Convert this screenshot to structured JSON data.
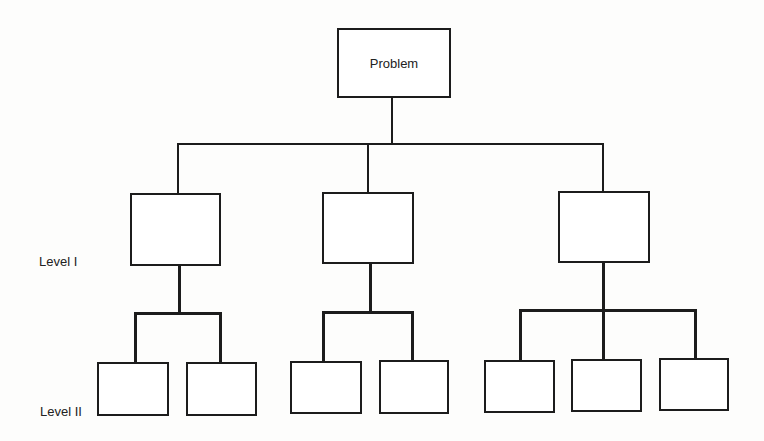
{
  "diagram": {
    "root": {
      "label": "Problem"
    },
    "levels": [
      {
        "label": "Level I"
      },
      {
        "label": "Level II"
      }
    ],
    "level_one_nodes": [
      {
        "label": "",
        "children_count": 2
      },
      {
        "label": "",
        "children_count": 2
      },
      {
        "label": "",
        "children_count": 3
      }
    ],
    "level_two_nodes": [
      {
        "label": "",
        "parent": 0
      },
      {
        "label": "",
        "parent": 0
      },
      {
        "label": "",
        "parent": 1
      },
      {
        "label": "",
        "parent": 1
      },
      {
        "label": "",
        "parent": 2
      },
      {
        "label": "",
        "parent": 2
      },
      {
        "label": "",
        "parent": 2
      }
    ],
    "colors": {
      "line": "#1c1c1c",
      "background": "#fdfdfc"
    }
  }
}
